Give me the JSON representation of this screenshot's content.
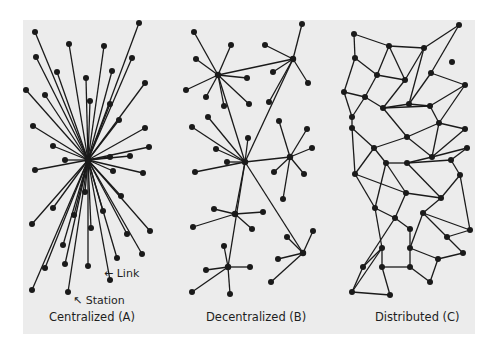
{
  "figure": {
    "background": "#ffffff",
    "panel_color": "#ececec",
    "ink_color": "#1a1a1a"
  },
  "diagrams": [
    {
      "id": "centralized",
      "caption": "Centralized (A)",
      "annotations": [
        {
          "id": "link",
          "label": "Link",
          "arrow": "←"
        },
        {
          "id": "station",
          "label": "Station",
          "arrow": "↖"
        }
      ],
      "hub": [
        88,
        160
      ],
      "nodes": [
        [
          139,
          23
        ],
        [
          35,
          32
        ],
        [
          69,
          44
        ],
        [
          104,
          46
        ],
        [
          36,
          57
        ],
        [
          132,
          58
        ],
        [
          57,
          72
        ],
        [
          112,
          71
        ],
        [
          145,
          83
        ],
        [
          26,
          90
        ],
        [
          86,
          78
        ],
        [
          45,
          95
        ],
        [
          90,
          101
        ],
        [
          110,
          104
        ],
        [
          119,
          120
        ],
        [
          33,
          126
        ],
        [
          145,
          128
        ],
        [
          53,
          146
        ],
        [
          149,
          147
        ],
        [
          130,
          156
        ],
        [
          110,
          157
        ],
        [
          65,
          160
        ],
        [
          35,
          170
        ],
        [
          143,
          173
        ],
        [
          113,
          171
        ],
        [
          85,
          192
        ],
        [
          121,
          196
        ],
        [
          53,
          208
        ],
        [
          32,
          224
        ],
        [
          74,
          215
        ],
        [
          103,
          211
        ],
        [
          150,
          231
        ],
        [
          91,
          228
        ],
        [
          63,
          245
        ],
        [
          127,
          234
        ],
        [
          142,
          254
        ],
        [
          117,
          258
        ],
        [
          65,
          264
        ],
        [
          45,
          268
        ],
        [
          88,
          266
        ],
        [
          110,
          280
        ],
        [
          32,
          290
        ],
        [
          68,
          292
        ]
      ]
    },
    {
      "id": "decentralized",
      "caption": "Decentralized (B)",
      "hubs": [
        [
          218,
          75
        ],
        [
          293,
          59
        ],
        [
          245,
          162
        ],
        [
          290,
          157
        ],
        [
          235,
          214
        ],
        [
          228,
          267
        ],
        [
          303,
          253
        ]
      ],
      "hub_links": [
        [
          0,
          1
        ],
        [
          0,
          2
        ],
        [
          1,
          2
        ],
        [
          2,
          3
        ],
        [
          2,
          4
        ],
        [
          2,
          5
        ],
        [
          2,
          6
        ]
      ],
      "leaves": [
        {
          "hub": 0,
          "nodes": [
            [
              194,
              32
            ],
            [
              231,
              45
            ],
            [
              196,
              59
            ],
            [
              186,
              90
            ],
            [
              206,
              97
            ],
            [
              247,
              78
            ],
            [
              224,
              106
            ],
            [
              249,
              104
            ]
          ]
        },
        {
          "hub": 1,
          "nodes": [
            [
              302,
              24
            ],
            [
              265,
              45
            ],
            [
              273,
              72
            ],
            [
              308,
              83
            ],
            [
              269,
              102
            ]
          ]
        },
        {
          "hub": 2,
          "nodes": [
            [
              208,
              117
            ],
            [
              192,
              127
            ],
            [
              216,
              149
            ],
            [
              248,
              138
            ],
            [
              227,
              162
            ],
            [
              195,
              172
            ]
          ]
        },
        {
          "hub": 3,
          "nodes": [
            [
              279,
              121
            ],
            [
              307,
              129
            ],
            [
              312,
              148
            ],
            [
              274,
              172
            ],
            [
              304,
              174
            ],
            [
              283,
              199
            ]
          ]
        },
        {
          "hub": 4,
          "nodes": [
            [
              214,
              209
            ],
            [
              263,
              212
            ],
            [
              193,
              227
            ],
            [
              252,
              229
            ]
          ]
        },
        {
          "hub": 5,
          "nodes": [
            [
              224,
              246
            ],
            [
              206,
              270
            ],
            [
              250,
              267
            ],
            [
              192,
              292
            ],
            [
              230,
              294
            ]
          ]
        },
        {
          "hub": 6,
          "nodes": [
            [
              313,
              231
            ],
            [
              287,
              237
            ],
            [
              278,
              259
            ],
            [
              271,
              282
            ]
          ]
        }
      ]
    },
    {
      "id": "distributed",
      "caption": "Distributed (C)",
      "nodes": [
        [
          354,
          34
        ],
        [
          459,
          25
        ],
        [
          389,
          46
        ],
        [
          424,
          48
        ],
        [
          355,
          58
        ],
        [
          452,
          62
        ],
        [
          377,
          75
        ],
        [
          405,
          80
        ],
        [
          431,
          73
        ],
        [
          465,
          85
        ],
        [
          344,
          92
        ],
        [
          365,
          97
        ],
        [
          383,
          108
        ],
        [
          409,
          104
        ],
        [
          430,
          106
        ],
        [
          439,
          123
        ],
        [
          352,
          117
        ],
        [
          465,
          129
        ],
        [
          352,
          128
        ],
        [
          407,
          137
        ],
        [
          374,
          148
        ],
        [
          432,
          157
        ],
        [
          467,
          148
        ],
        [
          386,
          163
        ],
        [
          407,
          163
        ],
        [
          451,
          160
        ],
        [
          355,
          174
        ],
        [
          406,
          193
        ],
        [
          441,
          198
        ],
        [
          460,
          175
        ],
        [
          375,
          208
        ],
        [
          423,
          213
        ],
        [
          395,
          218
        ],
        [
          410,
          229
        ],
        [
          470,
          230
        ],
        [
          447,
          237
        ],
        [
          382,
          248
        ],
        [
          363,
          267
        ],
        [
          410,
          248
        ],
        [
          382,
          267
        ],
        [
          410,
          267
        ],
        [
          463,
          253
        ],
        [
          438,
          259
        ],
        [
          430,
          282
        ],
        [
          352,
          292
        ],
        [
          390,
          295
        ]
      ],
      "edges": [
        [
          0,
          2
        ],
        [
          2,
          3
        ],
        [
          3,
          1
        ],
        [
          0,
          4
        ],
        [
          2,
          6
        ],
        [
          2,
          7
        ],
        [
          3,
          7
        ],
        [
          3,
          13
        ],
        [
          1,
          8
        ],
        [
          8,
          13
        ],
        [
          8,
          9
        ],
        [
          4,
          6
        ],
        [
          4,
          10
        ],
        [
          6,
          7
        ],
        [
          6,
          11
        ],
        [
          7,
          12
        ],
        [
          13,
          12
        ],
        [
          13,
          14
        ],
        [
          9,
          14
        ],
        [
          9,
          15
        ],
        [
          10,
          11
        ],
        [
          10,
          16
        ],
        [
          11,
          16
        ],
        [
          11,
          12
        ],
        [
          12,
          14
        ],
        [
          14,
          15
        ],
        [
          15,
          17
        ],
        [
          16,
          18
        ],
        [
          12,
          19
        ],
        [
          15,
          19
        ],
        [
          15,
          21
        ],
        [
          17,
          21
        ],
        [
          18,
          20
        ],
        [
          19,
          20
        ],
        [
          19,
          21
        ],
        [
          18,
          26
        ],
        [
          20,
          26
        ],
        [
          20,
          23
        ],
        [
          23,
          24
        ],
        [
          21,
          24
        ],
        [
          21,
          22
        ],
        [
          22,
          25
        ],
        [
          25,
          24
        ],
        [
          26,
          27
        ],
        [
          27,
          23
        ],
        [
          26,
          30
        ],
        [
          23,
          30
        ],
        [
          24,
          28
        ],
        [
          28,
          27
        ],
        [
          28,
          29
        ],
        [
          25,
          29
        ],
        [
          27,
          32
        ],
        [
          30,
          32
        ],
        [
          32,
          33
        ],
        [
          28,
          31
        ],
        [
          31,
          34
        ],
        [
          29,
          34
        ],
        [
          30,
          36
        ],
        [
          36,
          37
        ],
        [
          32,
          37
        ],
        [
          33,
          38
        ],
        [
          31,
          38
        ],
        [
          31,
          35
        ],
        [
          34,
          35
        ],
        [
          35,
          41
        ],
        [
          38,
          42
        ],
        [
          41,
          42
        ],
        [
          36,
          39
        ],
        [
          37,
          44
        ],
        [
          39,
          40
        ],
        [
          40,
          38
        ],
        [
          42,
          43
        ],
        [
          40,
          43
        ],
        [
          39,
          45
        ],
        [
          44,
          45
        ],
        [
          44,
          36
        ]
      ]
    }
  ]
}
